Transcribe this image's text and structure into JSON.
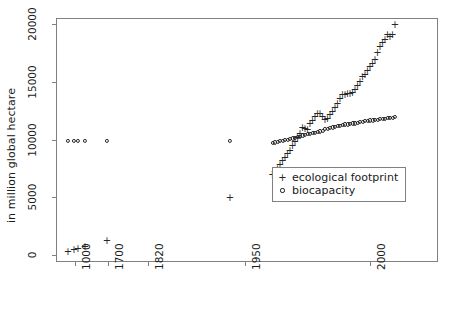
{
  "chart_data": {
    "type": "scatter",
    "title": "",
    "subtitle": "",
    "xlabel": "",
    "ylabel": "in million global hectare",
    "grid": false,
    "legend_position": "center-right",
    "xtype": "categorical-year",
    "x_categories": [
      "1000",
      "1700",
      "1820",
      "1950",
      "2000"
    ],
    "x_tick_labels": [
      "1000",
      "1700",
      "1820",
      "1950",
      "2000"
    ],
    "y_tick_labels": [
      "0",
      "5000",
      "10000",
      "15000",
      "20000"
    ],
    "y_ticks": [
      0,
      5000,
      10000,
      15000,
      20000
    ],
    "ylim": [
      0,
      21000
    ],
    "series": [
      {
        "name": "ecological footprint",
        "marker": "plus",
        "x": [
          1000,
          1500,
          1600,
          1700,
          1820,
          1950,
          1961,
          1962,
          1963,
          1964,
          1965,
          1966,
          1967,
          1968,
          1969,
          1970,
          1971,
          1972,
          1973,
          1974,
          1975,
          1976,
          1977,
          1978,
          1979,
          1980,
          1981,
          1982,
          1983,
          1984,
          1985,
          1986,
          1987,
          1988,
          1989,
          1990,
          1991,
          1992,
          1993,
          1994,
          1995,
          1996,
          1997,
          1998,
          1999,
          2000,
          2001,
          2002,
          2003,
          2004,
          2005,
          2006,
          2007,
          2008,
          2009,
          2010
        ],
        "y": [
          350,
          500,
          600,
          800,
          1300,
          5000,
          7000,
          7250,
          7500,
          7850,
          8200,
          8500,
          8800,
          9100,
          9500,
          9900,
          10200,
          10600,
          11100,
          11000,
          10900,
          11400,
          11700,
          12000,
          12300,
          12300,
          12000,
          11800,
          11900,
          12200,
          12500,
          12800,
          13200,
          13600,
          13900,
          13900,
          14000,
          14000,
          14100,
          14400,
          14700,
          15100,
          15500,
          15700,
          16000,
          16400,
          16600,
          17000,
          17600,
          18100,
          18400,
          18700,
          19100,
          19000,
          19100,
          20000
        ],
        "x_positions": [
          1000,
          1500,
          1600,
          1700,
          1820,
          1950,
          1961,
          1962,
          1963,
          1964,
          1965,
          1966,
          1967,
          1968,
          1969,
          1970,
          1971,
          1972,
          1973,
          1974,
          1975,
          1976,
          1977,
          1978,
          1979,
          1980,
          1981,
          1982,
          1983,
          1984,
          1985,
          1986,
          1987,
          1988,
          1989,
          1990,
          1991,
          1992,
          1993,
          1994,
          1995,
          1996,
          1997,
          1998,
          1999,
          2000,
          2001,
          2002,
          2003,
          2004,
          2005,
          2006,
          2007,
          2008,
          2009,
          2010
        ]
      },
      {
        "name": "biocapacity",
        "marker": "circle",
        "x": [
          1000,
          1500,
          1600,
          1700,
          1820,
          1950,
          1961,
          1962,
          1963,
          1964,
          1965,
          1966,
          1967,
          1968,
          1969,
          1970,
          1971,
          1972,
          1973,
          1974,
          1975,
          1976,
          1977,
          1978,
          1979,
          1980,
          1981,
          1982,
          1983,
          1984,
          1985,
          1986,
          1987,
          1988,
          1989,
          1990,
          1991,
          1992,
          1993,
          1994,
          1995,
          1996,
          1997,
          1998,
          1999,
          2000,
          2001,
          2002,
          2003,
          2004,
          2005,
          2006,
          2007,
          2008,
          2009,
          2010
        ],
        "y": [
          9900,
          9900,
          9900,
          9900,
          9900,
          9900,
          9700,
          9750,
          9800,
          9850,
          9900,
          9950,
          10000,
          10050,
          10100,
          10150,
          10200,
          10250,
          10350,
          10400,
          10450,
          10500,
          10550,
          10600,
          10650,
          10700,
          10750,
          10900,
          10950,
          11000,
          11050,
          11100,
          11150,
          11200,
          11250,
          11300,
          11300,
          11350,
          11400,
          11400,
          11450,
          11500,
          11550,
          11600,
          11600,
          11650,
          11650,
          11700,
          11700,
          11750,
          11800,
          11800,
          11850,
          11900,
          11900,
          11950
        ]
      }
    ],
    "legend_entries": [
      {
        "marker": "+",
        "label": "ecological footprint"
      },
      {
        "marker": "o",
        "label": "biocapacity"
      }
    ]
  }
}
